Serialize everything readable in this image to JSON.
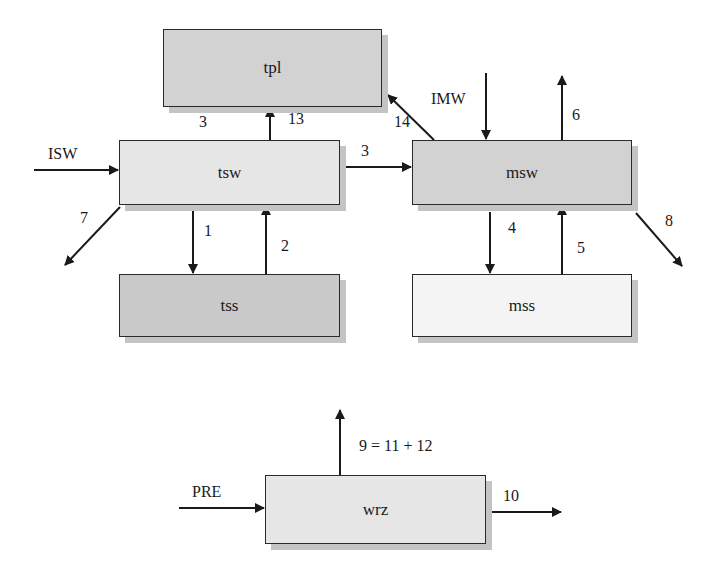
{
  "diagram": {
    "nodes": [
      {
        "id": "tpl",
        "label": "tpl"
      },
      {
        "id": "tsw",
        "label": "tsw"
      },
      {
        "id": "tss",
        "label": "tss"
      },
      {
        "id": "msw",
        "label": "msw"
      },
      {
        "id": "mss",
        "label": "mss"
      },
      {
        "id": "wrz",
        "label": "wrz"
      }
    ],
    "flows": [
      {
        "label": "ISW",
        "from": null,
        "to": "tsw"
      },
      {
        "label": "3",
        "from": "tsw",
        "to": "tpl"
      },
      {
        "label": "13",
        "from": "tsw",
        "to": "tpl"
      },
      {
        "label": "3",
        "from": "tsw",
        "to": "msw"
      },
      {
        "label": "7",
        "from": "tsw",
        "to": null
      },
      {
        "label": "1",
        "from": "tsw",
        "to": "tss"
      },
      {
        "label": "2",
        "from": "tss",
        "to": "tsw"
      },
      {
        "label": "IMW",
        "from": null,
        "to": "msw"
      },
      {
        "label": "14",
        "from": "msw",
        "to": "tpl"
      },
      {
        "label": "6",
        "from": "msw",
        "to": null
      },
      {
        "label": "8",
        "from": "msw",
        "to": null
      },
      {
        "label": "4",
        "from": "msw",
        "to": "mss"
      },
      {
        "label": "5",
        "from": "mss",
        "to": "msw"
      },
      {
        "label": "PRE",
        "from": null,
        "to": "wrz"
      },
      {
        "label": "9 = 11 + 12",
        "from": "wrz",
        "to": null
      },
      {
        "label": "10",
        "from": "wrz",
        "to": null
      }
    ]
  },
  "labels": {
    "isw": "ISW",
    "imw": "IMW",
    "pre": "PRE",
    "f1": "1",
    "f2": "2",
    "f3a": "3",
    "f3b": "3",
    "f4": "4",
    "f5": "5",
    "f6": "6",
    "f7": "7",
    "f8": "8",
    "f9": "9 = 11 + 12",
    "f10": "10",
    "f13": "13",
    "f14": "14"
  },
  "colors": {
    "line": "#1a1a1a",
    "shadow": "#c4c4c4"
  }
}
